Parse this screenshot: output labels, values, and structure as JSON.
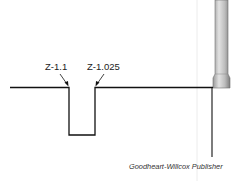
{
  "diagram": {
    "labels": {
      "left_point": "Z-1.1",
      "right_point": "Z-1.025"
    },
    "caption": "Goodheart-Willcox Publisher",
    "colors": {
      "line": "#111111",
      "tool_light": "#d4d4d4",
      "tool_dark": "#8a8a8a",
      "background": "#ffffff"
    }
  }
}
